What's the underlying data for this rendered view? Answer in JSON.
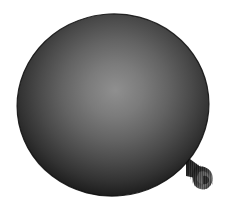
{
  "scene": {
    "width": 230,
    "height": 215,
    "background_color": "#ffffff",
    "subject": "balloon",
    "alt_text": "Dark gray inflated balloon on a white background"
  },
  "balloon": {
    "name": "balloon",
    "body_color_dark": "#0b0b0b",
    "body_color_mid": "#5e5e5e",
    "body_color_light": "#9a9a9a",
    "outline_color": "#151515",
    "center_x": 113,
    "center_y": 105,
    "radius_x": 96,
    "radius_y": 91,
    "rotation_deg": -6
  },
  "highlights": [
    {
      "name": "specular-highlight-left",
      "center_x": 92,
      "center_y": 99,
      "radius": 26,
      "peak_color": "#f2f2f2",
      "intensity": 0.85
    },
    {
      "name": "specular-highlight-right",
      "center_x": 139,
      "center_y": 92,
      "radius": 30,
      "peak_color": "#ffffff",
      "intensity": 1.0
    }
  ],
  "knot": {
    "name": "balloon-knot",
    "center_x": 203,
    "center_y": 178,
    "width": 18,
    "height": 22,
    "color_dark": "#141414",
    "color_mid": "#4a4a4a",
    "color_light": "#8a8a8a"
  },
  "texture": {
    "name": "vertical-scanline-texture",
    "type": "vertical-stripes",
    "period_px": 2,
    "opacity": 0.22,
    "stripe_color": "#000000"
  }
}
